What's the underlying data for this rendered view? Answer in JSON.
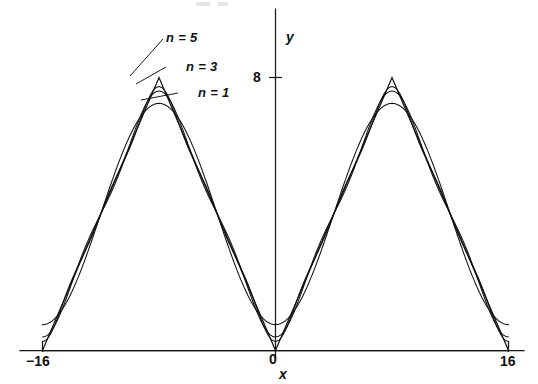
{
  "figure": {
    "background_color": "#ffffff",
    "ink_color": "#111111"
  },
  "axes": {
    "y_axis_label": "y",
    "x_axis_label": "x",
    "origin_label": "0",
    "y_tick_label": "8",
    "x_tick_left_label": "−16",
    "x_tick_right_label": "16"
  },
  "annotations": [
    {
      "id": "n5",
      "label": "n = 5"
    },
    {
      "id": "n3",
      "label": "n = 3"
    },
    {
      "id": "n1",
      "label": "n = 1"
    }
  ],
  "chart_data": {
    "type": "line",
    "title": "",
    "subtitle": "",
    "xlabel": "x",
    "ylabel": "y",
    "xlim": [
      -16,
      16
    ],
    "ylim": [
      0,
      9.2
    ],
    "grid": false,
    "legend_position": "inline-annotations",
    "x_ticks": [
      -16,
      0,
      16
    ],
    "x_tick_labels": [
      "−16",
      "0",
      "16"
    ],
    "y_ticks": [
      8
    ],
    "y_tick_labels": [
      "8"
    ],
    "function": {
      "name": "triangular wave",
      "period": 16,
      "peak": 8,
      "mean": 4,
      "formula": "f(x) = 4 - (32/pi^2) * sum_{k odd, k<=n} cos(k*pi*x/8)/k^2"
    },
    "series": [
      {
        "name": "n = 1",
        "terms": 1,
        "harmonics": [
          1
        ]
      },
      {
        "name": "n = 3",
        "terms": 2,
        "harmonics": [
          1,
          3
        ]
      },
      {
        "name": "n = 5",
        "terms": 3,
        "harmonics": [
          1,
          3,
          5
        ]
      },
      {
        "name": "exact",
        "terms": "infinite",
        "harmonics": "all odd"
      }
    ],
    "key_points": [
      {
        "x": -16,
        "y": 0
      },
      {
        "x": -8,
        "y": 8
      },
      {
        "x": 0,
        "y": 0
      },
      {
        "x": 8,
        "y": 8
      },
      {
        "x": 16,
        "y": 0
      }
    ]
  }
}
